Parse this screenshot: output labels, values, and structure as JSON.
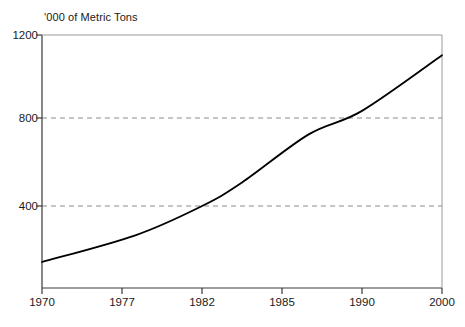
{
  "chart_data": {
    "type": "line",
    "title": "'000 of Metric Tons",
    "xlabel": "",
    "ylabel": "'000 of Metric Tons",
    "xlim": [
      1970,
      2000
    ],
    "ylim": [
      0,
      1200
    ],
    "grid": "horizontal dashed at 400 and 800",
    "legend": "none",
    "x_tick_labels": [
      "1970",
      "1977",
      "1982",
      "1985",
      "1990",
      "2000"
    ],
    "y_tick_labels": [
      "400",
      "800",
      "1200"
    ],
    "y_ticks": [
      400,
      800,
      1200
    ],
    "gridlines": [
      400,
      800
    ],
    "series": [
      {
        "name": "Metric Tons",
        "x": [
          1970,
          1977,
          1982,
          1985,
          1990,
          2000
        ],
        "values": [
          138,
          263,
          400,
          510,
          735,
          1105
        ],
        "points_detailed": [
          {
            "x": 1970,
            "y": 138
          },
          {
            "x": 1977,
            "y": 263
          },
          {
            "x": 1982,
            "y": 400
          },
          {
            "x": 1985,
            "y": 510
          },
          {
            "x": 1990,
            "y": 735
          },
          {
            "x": 1994,
            "y": 845
          },
          {
            "x": 2000,
            "y": 1105
          }
        ],
        "color": "#000000",
        "style": "solid"
      }
    ],
    "colors": {
      "line": "#000000",
      "axis": "#333333",
      "grid": "#999999",
      "background": "#ffffff",
      "text": "#1a1a1a"
    }
  },
  "axis": {
    "title": "'000 of Metric Tons",
    "y_labels": [
      {
        "text": "1200"
      },
      {
        "text": "800"
      },
      {
        "text": "400"
      }
    ],
    "x_labels": [
      {
        "text": "1970"
      },
      {
        "text": "1977"
      },
      {
        "text": "1982"
      },
      {
        "text": "1985"
      },
      {
        "text": "1990"
      },
      {
        "text": "2000"
      }
    ]
  }
}
